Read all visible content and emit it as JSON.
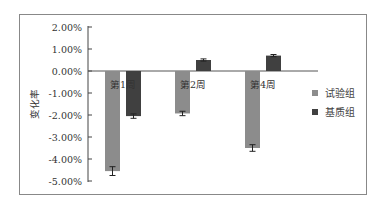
{
  "chart_data": {
    "type": "bar",
    "title": "",
    "xlabel": "",
    "ylabel": "变化率",
    "ylim": [
      -5.0,
      2.0
    ],
    "y_ticks": [
      "2.00%",
      "1.00%",
      "0.00%",
      "-1.00%",
      "-2.00%",
      "-3.00%",
      "-4.00%",
      "-5.00%"
    ],
    "categories": [
      "第1周",
      "第2周",
      "第4周"
    ],
    "series": [
      {
        "name": "试验组",
        "color": "#8c8c8c",
        "values": [
          -4.55,
          -1.93,
          -3.5
        ],
        "errors": [
          0.2,
          0.1,
          0.15
        ]
      },
      {
        "name": "基质组",
        "color": "#404040",
        "values": [
          -2.05,
          0.5,
          0.7
        ],
        "errors": [
          0.1,
          0.05,
          0.05
        ]
      }
    ],
    "legend_position": "right",
    "grid": false,
    "error_bars": true
  }
}
